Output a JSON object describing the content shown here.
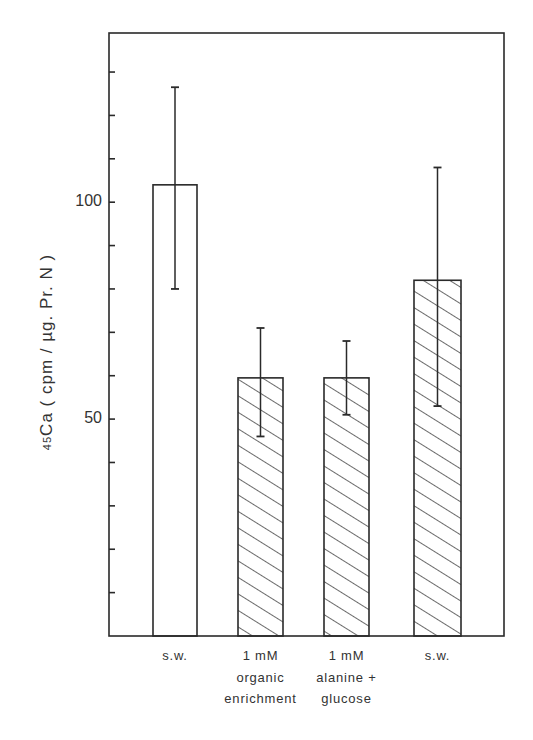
{
  "chart_data": {
    "type": "bar",
    "title": "",
    "xlabel": "",
    "ylabel": "45Ca (cpm/µg. Pr.N)",
    "ylabel_parts": {
      "superscript": "45",
      "main": "Ca  ( cpm / µg. Pr. N )"
    },
    "ylim": [
      0,
      139
    ],
    "yticks_major": [
      {
        "value": 100,
        "label": "100"
      },
      {
        "value": 50,
        "label": "50"
      }
    ],
    "yticks_minor_step": 10,
    "grid": false,
    "legend": null,
    "categories": [
      [
        "s.w."
      ],
      [
        "1 mM",
        "organic",
        "enrichment"
      ],
      [
        "1 mM",
        "alanine +",
        "glucose"
      ],
      [
        "s.w."
      ]
    ],
    "values": [
      104,
      59.5,
      59.5,
      82
    ],
    "error_bars": [
      {
        "upper": 126.5,
        "lower": 80
      },
      {
        "upper": 71,
        "lower": 46
      },
      {
        "upper": 68,
        "lower": 51
      },
      {
        "upper": 108,
        "lower": 53
      }
    ],
    "fill": [
      "open",
      "hatched",
      "hatched",
      "hatched"
    ]
  },
  "colors": {
    "ink": "#2a2a2a",
    "background": "#ffffff"
  }
}
